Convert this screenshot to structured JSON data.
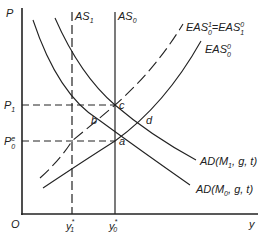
{
  "axes": {
    "y_label": "P",
    "x_label": "y",
    "origin_label": "O"
  },
  "price_levels": [
    {
      "id": "p1",
      "label": "P",
      "sub": "1",
      "sup": ""
    },
    {
      "id": "p0e",
      "label": "P",
      "sub": "0",
      "sup": "e"
    }
  ],
  "output_levels": [
    {
      "id": "y1",
      "label": "y",
      "sub": "1",
      "sup": "*"
    },
    {
      "id": "y0",
      "label": "y",
      "sub": "0",
      "sup": "*"
    }
  ],
  "curves": {
    "as1": {
      "label": "AS",
      "sub": "1",
      "style": "dashed"
    },
    "as0": {
      "label": "AS",
      "sub": "0",
      "style": "solid"
    },
    "eas_new": {
      "label": "EAS",
      "sup1": "1",
      "sub1": "0",
      "eq": "=",
      "label2": "EAS",
      "sup2": "0",
      "sub2": "1",
      "style": "dashed"
    },
    "eas0": {
      "label": "EAS",
      "sup": "0",
      "sub": "0",
      "style": "solid"
    },
    "ad1": {
      "label": "AD(M",
      "sub": "1",
      "rest": ", g, t)"
    },
    "ad0": {
      "label": "AD(M",
      "sub": "0",
      "rest": ", g, t)"
    }
  },
  "points": {
    "a": "a",
    "b": "b",
    "c": "c",
    "d": "d"
  }
}
